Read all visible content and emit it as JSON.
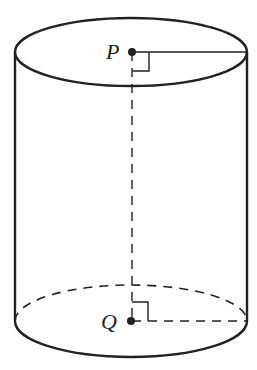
{
  "diagram": {
    "shape": "cylinder",
    "points": {
      "top_center": {
        "label": "P"
      },
      "bottom_center": {
        "label": "Q"
      }
    },
    "colors": {
      "stroke": "#222222",
      "background": "#ffffff"
    }
  }
}
